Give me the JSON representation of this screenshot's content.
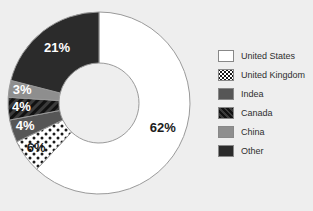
{
  "chart_data": {
    "type": "pie",
    "variant": "donut",
    "title": "",
    "xlabel": "",
    "ylabel": "",
    "value_unit": "%",
    "legend_position": "right",
    "grid": false,
    "categories": [
      "United States",
      "United Kingdom",
      "Indea",
      "Canada",
      "China",
      "Other"
    ],
    "values": [
      62,
      6,
      4,
      4,
      3,
      21
    ],
    "data_labels": [
      "62%",
      "6%",
      "4%",
      "4%",
      "3%",
      "21%"
    ],
    "slices": [
      {
        "label": "United States",
        "value": 62,
        "data_label": "62%",
        "fill": "#ffffff",
        "pattern": "solid",
        "label_color": "dark"
      },
      {
        "label": "United Kingdom",
        "value": 6,
        "data_label": "6%",
        "fill": "#ffffff",
        "pattern": "polka-dots",
        "label_color": "dark"
      },
      {
        "label": "Indea",
        "value": 4,
        "data_label": "4%",
        "fill": "#565656",
        "pattern": "solid",
        "label_color": "light"
      },
      {
        "label": "Canada",
        "value": 4,
        "data_label": "4%",
        "fill": "#3b3b3b",
        "pattern": "diag-hatch",
        "label_color": "light"
      },
      {
        "label": "China",
        "value": 3,
        "data_label": "3%",
        "fill": "#8e8e8e",
        "pattern": "solid",
        "label_color": "light"
      },
      {
        "label": "Other",
        "value": 21,
        "data_label": "21%",
        "fill": "#2b2b2b",
        "pattern": "solid",
        "label_color": "light"
      }
    ]
  },
  "legend": {
    "items": [
      {
        "label": "United States",
        "swatch": "white-solid"
      },
      {
        "label": "United Kingdom",
        "swatch": "white-polka-dots"
      },
      {
        "label": "Indea",
        "swatch": "gray-solid"
      },
      {
        "label": "Canada",
        "swatch": "dark-diagonal-hatch"
      },
      {
        "label": "China",
        "swatch": "light-gray-solid"
      },
      {
        "label": "Other",
        "swatch": "near-black-solid"
      }
    ]
  },
  "colors": {
    "background": "#eeeeee",
    "slice_united_states": "#ffffff",
    "slice_united_kingdom": "#ffffff",
    "slice_indea": "#565656",
    "slice_canada": "#3b3b3b",
    "slice_china": "#8e8e8e",
    "slice_other": "#2b2b2b",
    "slice_outline": "#9a9a9a",
    "legend_text": "#2e2e2e"
  }
}
